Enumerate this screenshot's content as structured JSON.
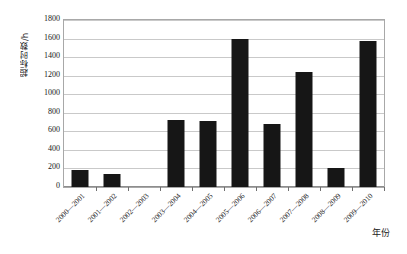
{
  "chart_data": {
    "type": "bar",
    "title": "",
    "subtitle": "",
    "xlabel": "年份",
    "ylabel": "超标时数/h",
    "categories": [
      "2000—2001",
      "2001—2002",
      "2002—2003",
      "2003—2004",
      "2004—2005",
      "2005—2006",
      "2006—2007",
      "2007—2008",
      "2008—2009",
      "2009—2010"
    ],
    "values": [
      180,
      140,
      0,
      725,
      710,
      1590,
      680,
      1240,
      205,
      1575
    ],
    "ylim": [
      0,
      1800
    ],
    "yticks": [
      0,
      200,
      400,
      600,
      800,
      1000,
      1200,
      1400,
      1600,
      1800
    ],
    "ytick_labels": [
      "0",
      "200",
      "400",
      "600",
      "800",
      "1000",
      "1200",
      "1400",
      "1600",
      "1800"
    ],
    "grid": true,
    "grid_axis": "y",
    "legend": false,
    "legend_position": "none",
    "bar_color": "#161616",
    "gridline_color": "#c9c9c9",
    "axis_color": "#a8a8a8",
    "plot_background": "#ffffff",
    "xtick_rotation": -45
  }
}
